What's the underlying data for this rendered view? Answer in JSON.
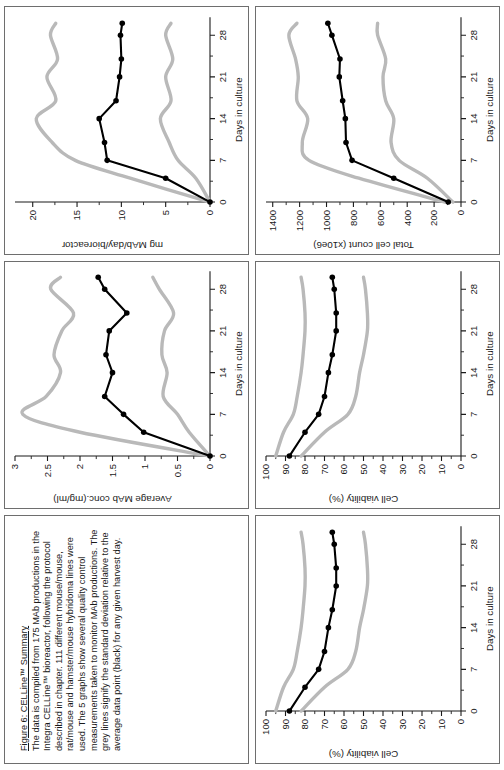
{
  "figure": {
    "caption_title": "Figure 6: CELLine™ Summary",
    "caption_body": "The data is compiled from 175 MAb productions in the Integra CELLine™ bioreactor, following the protocol described in chapter. 111 different mouse/mouse, rat/mouse and hamster/mouse hybridoma lines were used. The 5 graphs show several quality control measurements taken to monitor MAb productions. The grey lines signify the standard deviation relative to the average data point (black) for any given harvest day.",
    "series_legend": {
      "mean_label": "average data point (black)",
      "band_label": "standard deviation (grey)",
      "mean_color": "#000000",
      "band_color": "#b9b9b9"
    }
  },
  "chart_data": [
    {
      "id": "mab-conc",
      "type": "line",
      "title": "",
      "xlabel": "Days in culture",
      "ylabel": "Average MAb conc.(mg/ml)",
      "xlim": [
        0,
        31
      ],
      "ylim": [
        0,
        3
      ],
      "xticks": [
        0,
        7,
        14,
        21,
        28
      ],
      "xticklabels": [
        "0",
        "7",
        "14",
        "21",
        "28"
      ],
      "yticks": [
        0,
        0.5,
        1,
        1.5,
        2,
        2.5,
        3
      ],
      "yticklabels": [
        "0",
        "0.5",
        "1",
        "1.5",
        "2",
        "2.5",
        "3"
      ],
      "grid": false,
      "x": [
        0,
        4,
        7,
        10,
        14,
        17,
        21,
        24,
        28,
        30
      ],
      "series": [
        {
          "name": "average",
          "color": "#000000",
          "markers": true,
          "values": [
            0,
            1.02,
            1.33,
            1.62,
            1.5,
            1.6,
            1.55,
            1.28,
            1.62,
            1.72
          ]
        },
        {
          "name": "sd-upper",
          "color": "#b9b9b9",
          "markers": false,
          "values": [
            0,
            2.0,
            2.88,
            2.52,
            2.3,
            2.4,
            2.28,
            2.1,
            2.45,
            2.3
          ]
        },
        {
          "name": "sd-lower",
          "color": "#b9b9b9",
          "markers": false,
          "values": [
            0,
            0.32,
            0.5,
            0.72,
            0.66,
            0.74,
            0.7,
            0.56,
            0.78,
            0.88
          ]
        }
      ]
    },
    {
      "id": "mab-per-day",
      "type": "line",
      "title": "",
      "xlabel": "Days in culture",
      "ylabel": "mg MAb/day/bioreactor",
      "xlim": [
        0,
        31
      ],
      "ylim": [
        0,
        22
      ],
      "xticks": [
        0,
        7,
        14,
        21,
        28
      ],
      "xticklabels": [
        "0",
        "7",
        "14",
        "21",
        "28"
      ],
      "yticks": [
        0,
        5,
        10,
        15,
        20
      ],
      "yticklabels": [
        "0",
        "5",
        "10",
        "15",
        "20"
      ],
      "grid": false,
      "x": [
        0,
        4,
        7,
        10,
        14,
        17,
        21,
        24,
        28,
        30
      ],
      "series": [
        {
          "name": "average",
          "color": "#000000",
          "markers": true,
          "values": [
            0,
            5.0,
            11.6,
            11.9,
            12.5,
            10.6,
            10.2,
            10.0,
            10.1,
            9.9
          ]
        },
        {
          "name": "sd-upper",
          "color": "#b9b9b9",
          "markers": false,
          "values": [
            0,
            9.0,
            15.2,
            17.8,
            19.6,
            17.4,
            18.4,
            17.2,
            18.0,
            17.4
          ]
        },
        {
          "name": "sd-lower",
          "color": "#b9b9b9",
          "markers": false,
          "values": [
            0,
            1.6,
            3.6,
            4.6,
            5.6,
            4.4,
            5.0,
            4.2,
            5.0,
            4.4
          ]
        }
      ]
    },
    {
      "id": "total-cell-count",
      "type": "line",
      "title": "",
      "xlabel": "Days in culture",
      "ylabel": "Total cell count (x10e6)",
      "xlim": [
        0,
        31
      ],
      "ylim": [
        0,
        1450
      ],
      "xticks": [
        0,
        7,
        14,
        21,
        28
      ],
      "xticklabels": [
        "0",
        "7",
        "14",
        "21",
        "28"
      ],
      "yticks": [
        0,
        200,
        400,
        600,
        800,
        1000,
        1200,
        1400
      ],
      "yticklabels": [
        "0",
        "200",
        "400",
        "600",
        "800",
        "1000",
        "1200",
        "1400"
      ],
      "grid": false,
      "x": [
        0,
        4,
        7,
        10,
        14,
        17,
        21,
        24,
        28,
        30
      ],
      "series": [
        {
          "name": "average",
          "color": "#000000",
          "markers": true,
          "values": [
            95,
            500,
            810,
            855,
            860,
            880,
            905,
            900,
            960,
            990
          ]
        },
        {
          "name": "sd-upper",
          "color": "#b9b9b9",
          "markers": false,
          "values": [
            120,
            760,
            1130,
            1180,
            1140,
            1220,
            1210,
            1230,
            1280,
            1220
          ]
        },
        {
          "name": "sd-lower",
          "color": "#b9b9b9",
          "markers": false,
          "values": [
            60,
            250,
            460,
            520,
            500,
            560,
            580,
            560,
            620,
            620
          ]
        }
      ]
    },
    {
      "id": "cell-viability",
      "type": "line",
      "title": "",
      "xlabel": "Days in culture",
      "ylabel": "Cell viability (%)",
      "xlim": [
        0,
        31
      ],
      "ylim": [
        0,
        100
      ],
      "xticks": [
        0,
        7,
        14,
        21,
        28
      ],
      "xticklabels": [
        "0",
        "7",
        "14",
        "21",
        "28"
      ],
      "yticks": [
        0,
        10,
        20,
        30,
        40,
        50,
        60,
        70,
        80,
        90,
        100
      ],
      "yticklabels": [
        "0",
        "10",
        "20",
        "30",
        "40",
        "50",
        "60",
        "70",
        "80",
        "90",
        "100"
      ],
      "grid": false,
      "x": [
        0,
        4,
        7,
        10,
        14,
        17,
        21,
        24,
        28,
        30
      ],
      "series": [
        {
          "name": "average",
          "color": "#000000",
          "markers": true,
          "values": [
            88,
            80,
            73,
            70,
            68,
            66,
            64,
            64,
            65,
            66
          ]
        },
        {
          "name": "sd-upper",
          "color": "#b9b9b9",
          "markers": false,
          "values": [
            95,
            91,
            86,
            84,
            82,
            81,
            80,
            80,
            81,
            82
          ]
        },
        {
          "name": "sd-lower",
          "color": "#b9b9b9",
          "markers": false,
          "values": [
            82,
            70,
            58,
            54,
            52,
            50,
            48,
            48,
            49,
            50
          ]
        }
      ]
    }
  ]
}
